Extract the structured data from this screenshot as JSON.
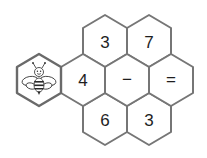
{
  "puzzle": {
    "cells": {
      "top_left": "3",
      "top_right": "7",
      "mid_bee": "bee",
      "mid_1": "4",
      "mid_2": "−",
      "mid_3": "=",
      "bottom_left": "6",
      "bottom_right": "3"
    },
    "colors": {
      "border": "#767676",
      "fill": "#ffffff",
      "text": "#1e1e1e"
    }
  }
}
